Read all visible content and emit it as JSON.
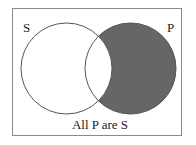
{
  "diagram": {
    "type": "venn",
    "sets": [
      {
        "id": "S",
        "label": "S",
        "shaded": false
      },
      {
        "id": "P",
        "label": "P",
        "shaded": true,
        "shaded_region": "P outside S"
      }
    ],
    "caption": "All P are S",
    "colors": {
      "shade": "#666666",
      "outline": "#555555",
      "frame": "#8a8a8a",
      "background": "#ffffff"
    }
  }
}
